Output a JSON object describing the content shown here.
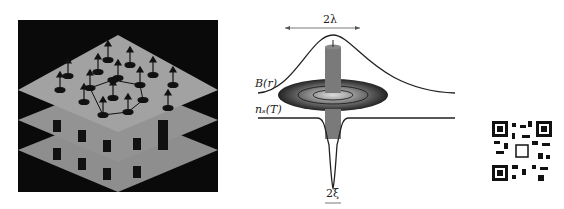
{
  "figure": {
    "left_panel": {
      "description": "Stacked superconducting layers with vortex lattice (arrows denote flux lines)",
      "layers": 3,
      "vortex_count": 16
    },
    "right_panel": {
      "labels": {
        "field_profile": "B(r)",
        "density_profile": "n_s(T)",
        "density_profile_display": "nₛ(T)",
        "penetration_width": "2λ",
        "coherence_width": "2ξ"
      }
    },
    "qr_code": {
      "present": true
    }
  },
  "colors": {
    "background": "#ffffff",
    "lattice_bg": "#0a0a0a",
    "plane": "#9a9a9a",
    "curve": "#222222",
    "cylinder": "#7a7a7a"
  }
}
